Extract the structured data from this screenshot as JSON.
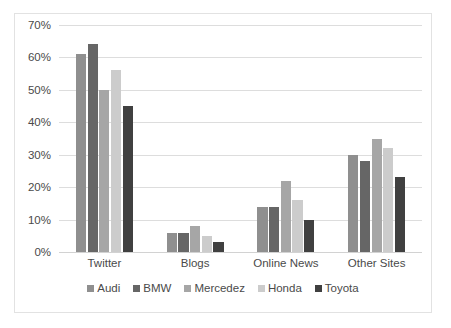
{
  "chart_data": {
    "type": "bar",
    "title": "",
    "subtitle": "",
    "xlabel": "",
    "ylabel": "",
    "categories": [
      "Twitter",
      "Blogs",
      "Online News",
      "Other Sites"
    ],
    "series": [
      {
        "name": "Audi",
        "values": [
          61,
          6,
          14,
          30
        ],
        "color": "#8f8f8f"
      },
      {
        "name": "BMW",
        "values": [
          64,
          6,
          14,
          28
        ],
        "color": "#666666"
      },
      {
        "name": "Mercedez",
        "values": [
          50,
          8,
          22,
          35
        ],
        "color": "#a6a6a6"
      },
      {
        "name": "Honda",
        "values": [
          56,
          5,
          16,
          32
        ],
        "color": "#cccccc"
      },
      {
        "name": "Toyota",
        "values": [
          45,
          3,
          10,
          23
        ],
        "color": "#404040"
      }
    ],
    "ylim": [
      0,
      70
    ],
    "ytick_values": [
      70,
      60,
      50,
      40,
      30,
      20,
      10,
      0
    ],
    "ytick_labels": [
      "70%",
      "60%",
      "50%",
      "40%",
      "30%",
      "20%",
      "10%",
      "0%"
    ],
    "grid": "horizontal",
    "legend_position": "bottom",
    "value_suffix": "%",
    "plot_background": "#ffffff",
    "gridline_color": "#dddddd",
    "border_color": "#e2e2e2",
    "text_color": "#4a4a4a"
  }
}
